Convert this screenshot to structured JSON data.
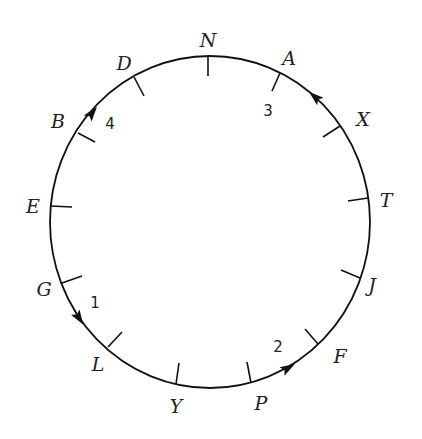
{
  "diagram": {
    "type": "circular route",
    "colors": {
      "line": "#111111",
      "text": "#222222",
      "background": "#ffffff"
    },
    "circle": {
      "cx": 210,
      "cy": 222,
      "rx": 160,
      "ry": 166
    },
    "stations": [
      {
        "id": "N",
        "label": "N",
        "tick": [
          208,
          56,
          208,
          76
        ],
        "text": [
          208,
          47
        ]
      },
      {
        "id": "A",
        "label": "A",
        "tick": [
          280,
          73,
          272,
          91
        ],
        "text": [
          289,
          65
        ]
      },
      {
        "id": "X",
        "label": "X",
        "tick": [
          340,
          126,
          323,
          137
        ],
        "text": [
          363,
          126
        ]
      },
      {
        "id": "T",
        "label": "T",
        "tick": [
          368,
          198,
          348,
          201
        ],
        "text": [
          386,
          207
        ]
      },
      {
        "id": "J",
        "label": "J",
        "tick": [
          360,
          278,
          341,
          270
        ],
        "text": [
          372,
          292
        ]
      },
      {
        "id": "F",
        "label": "F",
        "tick": [
          318,
          344,
          305,
          329
        ],
        "text": [
          340,
          363
        ]
      },
      {
        "id": "P",
        "label": "P",
        "tick": [
          251,
          383,
          247,
          362
        ],
        "text": [
          261,
          410
        ]
      },
      {
        "id": "Y",
        "label": "Y",
        "tick": [
          176,
          384,
          179,
          363
        ],
        "text": [
          176,
          413
        ]
      },
      {
        "id": "L",
        "label": "L",
        "tick": [
          108,
          347,
          122,
          332
        ],
        "text": [
          98,
          371
        ]
      },
      {
        "id": "G",
        "label": "G",
        "tick": [
          62,
          283,
          82,
          276
        ],
        "text": [
          44,
          296
        ]
      },
      {
        "id": "E",
        "label": "E",
        "tick": [
          51,
          206,
          72,
          207
        ],
        "text": [
          33,
          213
        ]
      },
      {
        "id": "B",
        "label": "B",
        "tick": [
          78,
          133,
          95,
          142
        ],
        "text": [
          58,
          128
        ]
      },
      {
        "id": "D",
        "label": "D",
        "tick": [
          134,
          77,
          144,
          96
        ],
        "text": [
          124,
          70
        ]
      }
    ],
    "steps": [
      {
        "id": "1",
        "label": "1",
        "from": "G",
        "to": "L",
        "direction": "clockwise-down",
        "arrow": {
          "x": 79,
          "y": 318,
          "angle": 58
        },
        "text": [
          95,
          308
        ]
      },
      {
        "id": "2",
        "label": "2",
        "from": "P",
        "to": "F",
        "direction": "toward F",
        "arrow": {
          "x": 288,
          "y": 368,
          "angle": -30
        },
        "text": [
          278,
          352
        ]
      },
      {
        "id": "3",
        "label": "3",
        "from": "X",
        "to": "A",
        "direction": "toward A",
        "arrow": {
          "x": 315,
          "y": 97,
          "angle": -140
        },
        "text": [
          268,
          116
        ]
      },
      {
        "id": "4",
        "label": "4",
        "from": "B",
        "to": "D",
        "direction": "toward D",
        "arrow": {
          "x": 92,
          "y": 113,
          "angle": -52
        },
        "text": [
          110,
          129
        ]
      }
    ]
  }
}
